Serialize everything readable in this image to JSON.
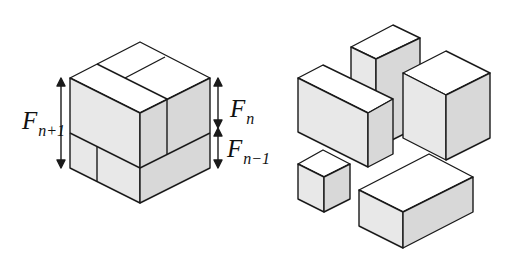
{
  "figure": {
    "left_panel": {
      "description": "Cube of side F(n+1) decomposed into cuboids of sizes F(n) and F(n-1)",
      "labels": {
        "total_height": {
          "main": "F",
          "sub": "n+1"
        },
        "upper_height": {
          "main": "F",
          "sub": "n"
        },
        "lower_height": {
          "main": "F",
          "sub": "n−1"
        }
      }
    },
    "right_panel": {
      "description": "Exploded view of the five component boxes",
      "pieces": [
        "tall-box",
        "wide-box",
        "large-cube",
        "small-cube",
        "flat-box"
      ]
    },
    "colors": {
      "stroke": "#1a1a1a",
      "top_face": "#ffffff",
      "left_face": "#e6e6e6",
      "right_face": "#d6d6d6"
    }
  }
}
